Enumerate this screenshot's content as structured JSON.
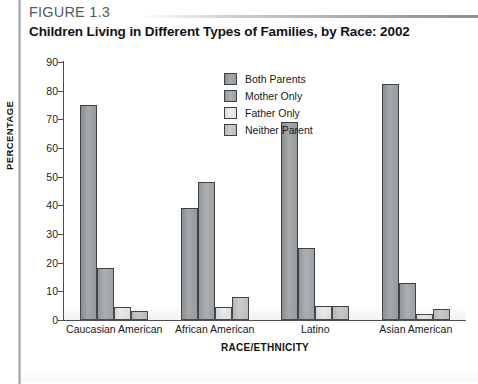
{
  "figure": {
    "number": "FIGURE 1.3",
    "title": "Children Living in Different Types of Families, by Race: 2002"
  },
  "chart_data": {
    "type": "bar",
    "title": "Children Living in Different Types of Families, by Race: 2002",
    "xlabel": "RACE/ETHNICITY",
    "ylabel": "PERCENTAGE",
    "ylim": [
      0,
      90
    ],
    "yticks": [
      0,
      10,
      20,
      30,
      40,
      50,
      60,
      70,
      80,
      90
    ],
    "grid": false,
    "legend_position": "inside-top-center",
    "categories": [
      "Caucasian American",
      "African American",
      "Latino",
      "Asian American"
    ],
    "series": [
      {
        "name": "Both Parents",
        "color": "#9a9d9f",
        "values": [
          75,
          39,
          69,
          82.5
        ]
      },
      {
        "name": "Mother Only",
        "color": "#a2a5a8",
        "values": [
          18,
          48,
          25,
          13
        ]
      },
      {
        "name": "Father Only",
        "color": "#e6e8e9",
        "values": [
          4.5,
          4.5,
          5,
          2
        ]
      },
      {
        "name": "Neither Parent",
        "color": "#c2c5c7",
        "values": [
          3,
          8,
          5,
          4
        ]
      }
    ]
  }
}
